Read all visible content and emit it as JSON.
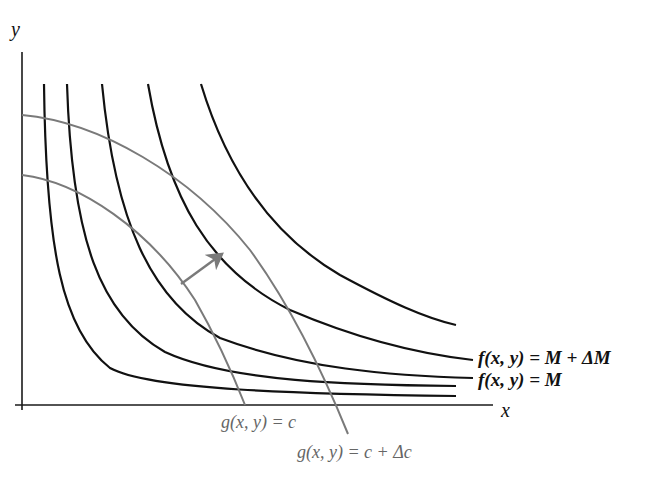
{
  "diagram": {
    "axes": {
      "x_label": "x",
      "y_label": "y"
    },
    "level_curve_labels": {
      "upper": "f(x, y) = M + ΔM",
      "lower": "f(x, y) = M"
    },
    "constraint_labels": {
      "inner": "g(x, y) = c",
      "outer": "g(x, y) = c + Δc"
    },
    "level_curve_count": 5,
    "constraint_curve_count": 2,
    "colors": {
      "level_curves": "#111111",
      "constraint_curves": "#7a7a7a",
      "arrow": "#7a7a7a",
      "background": "#ffffff"
    }
  }
}
